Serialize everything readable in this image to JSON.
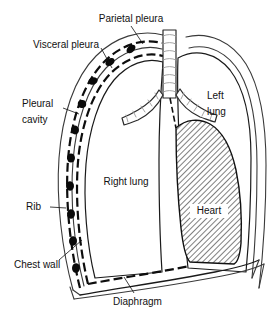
{
  "figure": {
    "background_color": "#ffffff",
    "line_color": "#111111",
    "heart_fill_pattern": "diagonal-hatch",
    "heart_fill_color": "#d9d9d9"
  },
  "labels": {
    "parietal_pleura": "Parietal pleura",
    "visceral_pleura": "Visceral pleura",
    "pleural_cavity_line1": "Pleural",
    "pleural_cavity_line2": "cavity",
    "rib": "Rib",
    "chest_wall": "Chest wall",
    "diaphragm": "Diaphragm",
    "right_lung": "Right lung",
    "left_lung_line1": "Left",
    "left_lung_line2": "lung",
    "heart": "Heart"
  }
}
